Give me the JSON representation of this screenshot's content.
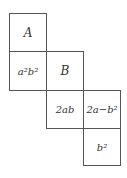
{
  "diagram": {
    "type": "cube-net",
    "cells": [
      {
        "id": "A",
        "label": "A",
        "row": 0,
        "col": 0
      },
      {
        "id": "a2b2",
        "label": "a²b²",
        "row": 1,
        "col": 0
      },
      {
        "id": "B",
        "label": "B",
        "row": 1,
        "col": 1
      },
      {
        "id": "2ab",
        "label": "2ab",
        "row": 2,
        "col": 1
      },
      {
        "id": "2a-b2",
        "label": "2a−b²",
        "row": 2,
        "col": 2
      },
      {
        "id": "b2",
        "label": "b²",
        "row": 3,
        "col": 2
      }
    ],
    "line_color": "#555555",
    "text_color": "#333333"
  }
}
